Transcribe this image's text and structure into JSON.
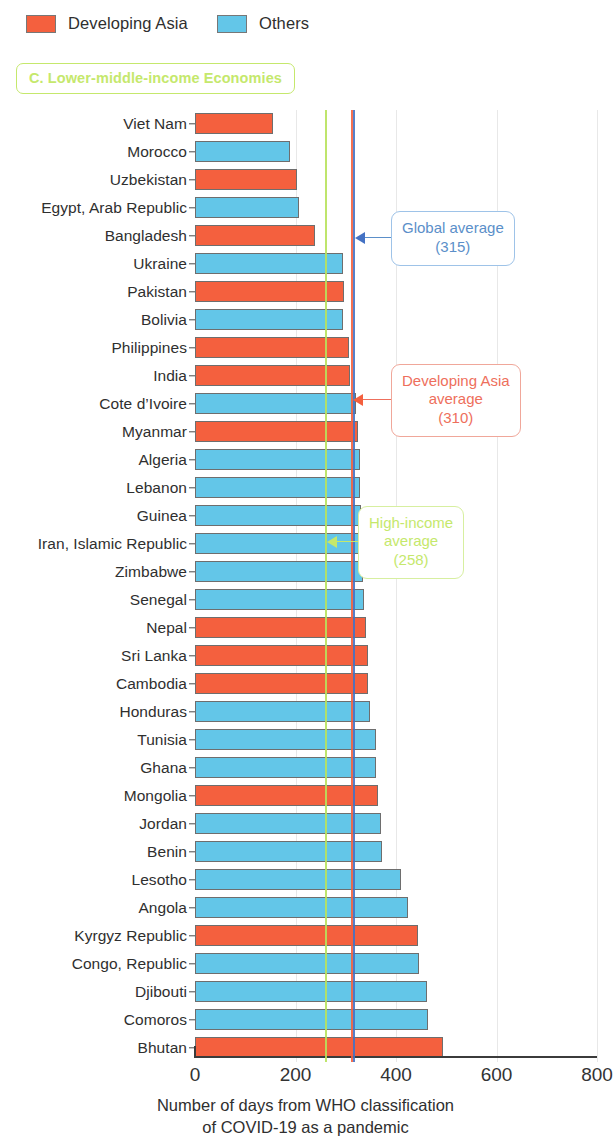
{
  "legend": {
    "items": [
      {
        "label": "Developing Asia",
        "color": "#f4603e",
        "key": "asia"
      },
      {
        "label": "Others",
        "color": "#63c6e8",
        "key": "others"
      }
    ]
  },
  "panel": {
    "title": "C. Lower-middle-income Economies",
    "title_color": "#c5e86c"
  },
  "annotations": [
    {
      "name": "global-average",
      "lines": [
        "Global average",
        "(315)"
      ],
      "value": 315,
      "color": "#4472c4"
    },
    {
      "name": "developing-asia-average",
      "lines": [
        "Developing Asia",
        "average",
        "(310)"
      ],
      "value": 310,
      "color": "#f4603e"
    },
    {
      "name": "high-income-average",
      "lines": [
        "High-income",
        "average",
        "(258)"
      ],
      "value": 258,
      "color": "#c5e86c"
    }
  ],
  "chart_data": {
    "type": "bar",
    "orientation": "horizontal",
    "title": "C. Lower-middle-income Economies",
    "xlabel": "Number of days from WHO classification of COVID-19 as a pandemic",
    "ylabel": "",
    "xlim": [
      0,
      800
    ],
    "xticks": [
      0,
      200,
      400,
      600,
      800
    ],
    "grid": true,
    "legend_position": "top-left",
    "categories": [
      "Viet Nam",
      "Morocco",
      "Uzbekistan",
      "Egypt, Arab Republic",
      "Bangladesh",
      "Ukraine",
      "Pakistan",
      "Bolivia",
      "Philippines",
      "India",
      "Cote d’Ivoire",
      "Myanmar",
      "Algeria",
      "Lebanon",
      "Guinea",
      "Iran, Islamic Republic",
      "Zimbabwe",
      "Senegal",
      "Nepal",
      "Sri Lanka",
      "Cambodia",
      "Honduras",
      "Tunisia",
      "Ghana",
      "Mongolia",
      "Jordan",
      "Benin",
      "Lesotho",
      "Angola",
      "Kyrgyz Republic",
      "Congo, Republic",
      "Djibouti",
      "Comoros",
      "Bhutan"
    ],
    "values": [
      156,
      190,
      202,
      206,
      238,
      294,
      296,
      294,
      306,
      308,
      320,
      324,
      328,
      328,
      330,
      334,
      334,
      336,
      340,
      344,
      344,
      348,
      360,
      360,
      364,
      370,
      372,
      410,
      424,
      444,
      446,
      462,
      464,
      494
    ],
    "groups": [
      "asia",
      "others",
      "asia",
      "others",
      "asia",
      "others",
      "asia",
      "others",
      "asia",
      "asia",
      "others",
      "asia",
      "others",
      "others",
      "others",
      "others",
      "others",
      "others",
      "asia",
      "asia",
      "asia",
      "others",
      "others",
      "others",
      "asia",
      "others",
      "others",
      "others",
      "others",
      "asia",
      "others",
      "others",
      "others",
      "asia"
    ],
    "reference_lines": [
      {
        "label": "High-income average",
        "value": 258,
        "color": "#c5e86c"
      },
      {
        "label": "Developing Asia average",
        "value": 310,
        "color": "#f4603e"
      },
      {
        "label": "Global average",
        "value": 315,
        "color": "#4472c4"
      }
    ]
  },
  "xaxis": {
    "title_line1": "Number of days from WHO classification",
    "title_line2": "of COVID-19 as a pandemic",
    "ticks": [
      "0",
      "200",
      "400",
      "600",
      "800"
    ]
  }
}
